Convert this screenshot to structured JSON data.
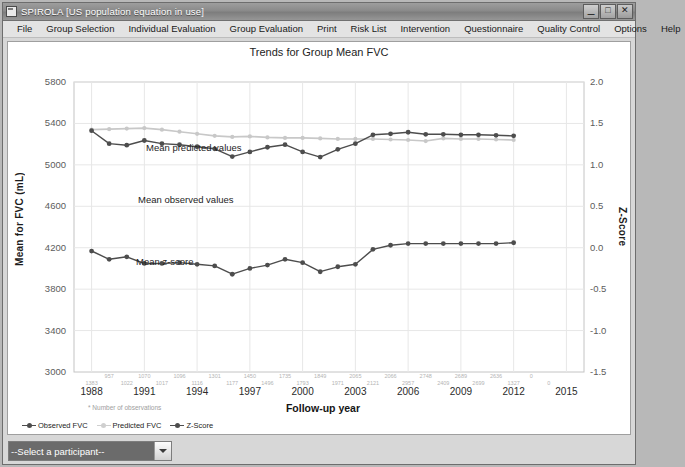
{
  "window": {
    "title": "SPIROLA  [US population equation in use]",
    "icon": "app-icon",
    "minimize": "_",
    "maximize": "□",
    "close": "✕"
  },
  "menubar": {
    "items": [
      {
        "label": "File"
      },
      {
        "label": "Group Selection"
      },
      {
        "label": "Individual Evaluation"
      },
      {
        "label": "Group Evaluation"
      },
      {
        "label": "Print"
      },
      {
        "label": "Risk List"
      },
      {
        "label": "Intervention"
      },
      {
        "label": "Questionnaire"
      },
      {
        "label": "Quality Control"
      },
      {
        "label": "Options"
      },
      {
        "label": "Help"
      }
    ]
  },
  "footer": {
    "participant_select_value": "--Select a participant--"
  },
  "chart_data": {
    "type": "line",
    "title": "Trends for Group Mean FVC",
    "xlabel": "Follow-up year",
    "ylabel": "Mean for FVC (mL)",
    "ylabel_right": "Z-Score",
    "ylim": [
      3000,
      5800
    ],
    "yticks": [
      3000,
      3400,
      3800,
      4200,
      4600,
      5000,
      5400,
      5800
    ],
    "ylim_right": [
      -1.5,
      2.0
    ],
    "yticks_right": [
      "-1.5",
      "-1.0",
      "-0.5",
      "0.0",
      "0.5",
      "1.0",
      "1.5",
      "2.0"
    ],
    "xlim": [
      1987,
      2016
    ],
    "xticks": [
      1988,
      1991,
      1994,
      1997,
      2000,
      2003,
      2006,
      2009,
      2012,
      2015
    ],
    "grid": true,
    "legend_position": "bottom-left",
    "observations_note": "* Number of observations",
    "observations_top": [
      "957",
      "1070",
      "1096",
      "1301",
      "1450",
      "1735",
      "1849",
      "2065",
      "2066",
      "2748",
      "2689",
      "2636",
      "0"
    ],
    "observations_bottom": [
      "1383",
      "1022",
      "1017",
      "1116",
      "1177",
      "1496",
      "1793",
      "1971",
      "2121",
      "2957",
      "2409",
      "2699",
      "1327",
      "0"
    ],
    "x": [
      1988,
      1989,
      1990,
      1991,
      1992,
      1993,
      1994,
      1995,
      1996,
      1997,
      1998,
      1999,
      2000,
      2001,
      2002,
      2003,
      2004,
      2005,
      2006,
      2007,
      2008,
      2009,
      2010,
      2011,
      2012
    ],
    "series": [
      {
        "name": "Predicted FVC",
        "annotation": "Mean predicted values",
        "color": "#c8c8c8",
        "axis": "left",
        "values": [
          5340,
          5345,
          5350,
          5355,
          5340,
          5320,
          5300,
          5280,
          5270,
          5275,
          5265,
          5260,
          5260,
          5255,
          5250,
          5250,
          5250,
          5245,
          5240,
          5230,
          5255,
          5250,
          5250,
          5245,
          5240
        ]
      },
      {
        "name": "Observed FVC",
        "annotation": "Mean observed values",
        "color": "#4d4d4d",
        "axis": "left",
        "values": [
          5330,
          5205,
          5190,
          5235,
          5205,
          5195,
          5175,
          5155,
          5080,
          5125,
          5170,
          5195,
          5125,
          5075,
          5150,
          5205,
          5290,
          5300,
          5315,
          5295,
          5295,
          5290,
          5290,
          5285,
          5280
        ]
      },
      {
        "name": "Z-Score",
        "annotation": "Mean z-score",
        "color": "#4d4d4d",
        "axis": "right",
        "values": [
          -0.04,
          -0.14,
          -0.11,
          -0.19,
          -0.19,
          -0.18,
          -0.2,
          -0.22,
          -0.32,
          -0.25,
          -0.21,
          -0.14,
          -0.18,
          -0.29,
          -0.23,
          -0.2,
          -0.02,
          0.03,
          0.05,
          0.05,
          0.05,
          0.05,
          0.05,
          0.05,
          0.06
        ]
      }
    ],
    "legend": [
      {
        "label": "Observed FVC",
        "color": "#4d4d4d"
      },
      {
        "label": "Predicted FVC",
        "color": "#cfcfcf"
      },
      {
        "label": "Z-Score",
        "color": "#4d4d4d"
      }
    ]
  }
}
